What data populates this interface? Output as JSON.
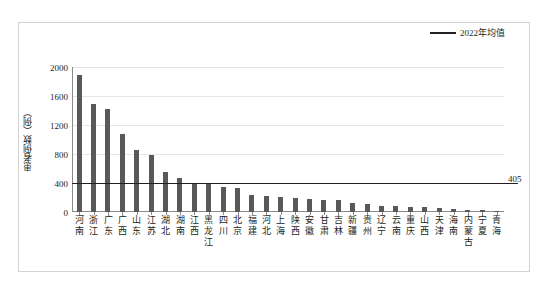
{
  "chart_data": {
    "type": "bar",
    "title": "",
    "xlabel": "",
    "ylabel": "患者例数（例）",
    "ylim": [
      0,
      2000
    ],
    "yticks": [
      0,
      400,
      800,
      1200,
      1600,
      2000
    ],
    "grid": true,
    "legend_position": "top-right",
    "legend": [
      {
        "name": "2022年均值",
        "type": "line",
        "color": "#231f20"
      }
    ],
    "bar_color": "#595959",
    "categories": [
      "河南",
      "浙江",
      "广东",
      "广西",
      "山东",
      "江苏",
      "湖北",
      "湖南",
      "江西",
      "黑龙江",
      "四川",
      "北京",
      "福建",
      "河北",
      "上海",
      "陕西",
      "安徽",
      "甘肃",
      "吉林",
      "新疆",
      "贵州",
      "辽宁",
      "云南",
      "重庆",
      "山西",
      "天津",
      "海南",
      "内蒙古",
      "宁夏",
      "青海"
    ],
    "values": [
      1890,
      1490,
      1420,
      1080,
      860,
      780,
      555,
      470,
      400,
      390,
      340,
      325,
      235,
      225,
      210,
      195,
      180,
      168,
      165,
      125,
      108,
      85,
      82,
      72,
      68,
      55,
      35,
      28,
      22,
      12
    ],
    "series": [
      {
        "name": "患者例数",
        "values": [
          1890,
          1490,
          1420,
          1080,
          860,
          780,
          555,
          470,
          400,
          390,
          340,
          325,
          235,
          225,
          210,
          195,
          180,
          168,
          165,
          125,
          108,
          85,
          82,
          72,
          68,
          55,
          35,
          28,
          22,
          12
        ]
      }
    ],
    "annotations": [
      {
        "name": "mean-line",
        "label": "405",
        "value": 405,
        "orientation": "horizontal"
      }
    ]
  },
  "axis": {
    "y_title": "患者例数（例）",
    "tick_2000": "2000",
    "tick_1600": "1600",
    "tick_1200": "1200",
    "tick_800": "800",
    "tick_400": "400",
    "tick_0": "0"
  },
  "legend": {
    "mean_label": "2022年均值"
  },
  "mean": {
    "label": "405"
  },
  "caption": {
    "text": ""
  }
}
